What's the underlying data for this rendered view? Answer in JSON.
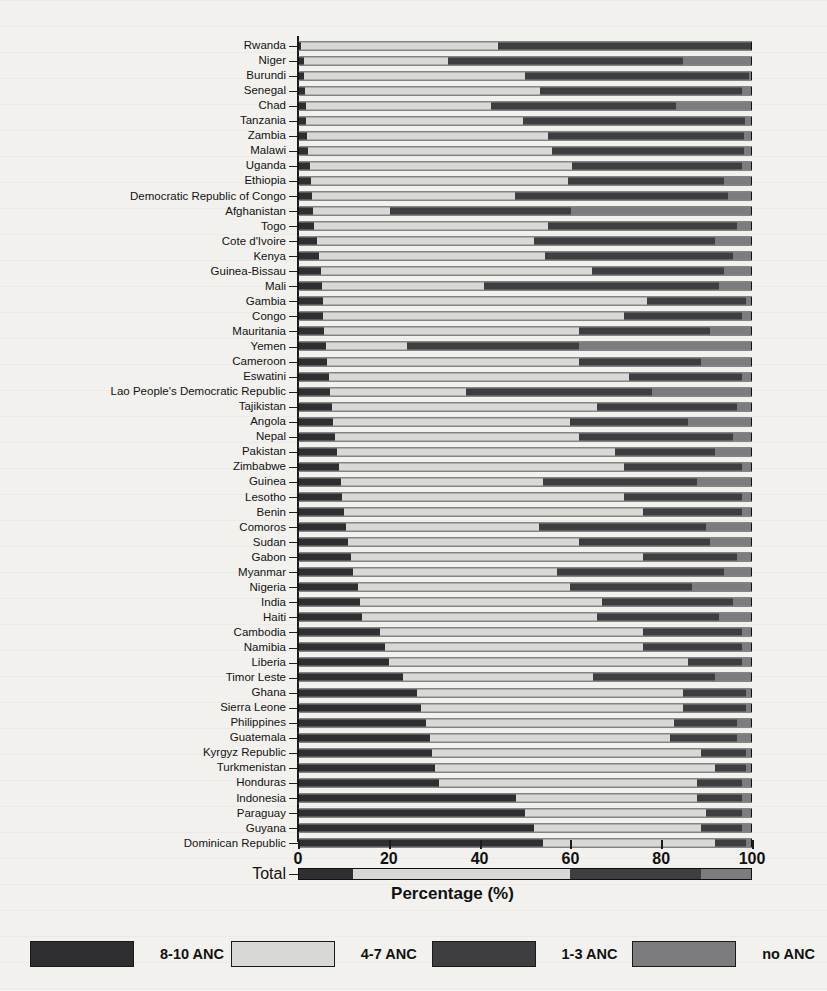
{
  "chart_data": {
    "type": "bar",
    "orientation": "horizontal",
    "stacked": true,
    "title": "",
    "xlabel": "Percentage (%)",
    "ylabel": "",
    "xlim": [
      0,
      100
    ],
    "xticks": [
      0,
      20,
      40,
      60,
      80,
      100
    ],
    "grid": false,
    "legend_position": "bottom",
    "legend": [
      "8-10 ANC",
      "4-7 ANC",
      "1-3 ANC",
      "no ANC"
    ],
    "series": [
      {
        "name": "8-10 ANC",
        "color": "#2f2f31"
      },
      {
        "name": "4-7 ANC",
        "color": "#d8d8d6"
      },
      {
        "name": "1-3 ANC",
        "color": "#3e3e40"
      },
      {
        "name": "no ANC",
        "color": "#7c7c7e"
      }
    ],
    "categories": [
      "Rwanda",
      "Niger",
      "Burundi",
      "Senegal",
      "Chad",
      "Tanzania",
      "Zambia",
      "Malawi",
      "Uganda",
      "Ethiopia",
      "Democratic Republic of Congo",
      "Afghanistan",
      "Togo",
      "Cote d'Ivoire",
      "Kenya",
      "Guinea-Bissau",
      "Mali",
      "Gambia",
      "Congo",
      "Mauritania",
      "Yemen",
      "Cameroon",
      "Eswatini",
      "Lao People's Democratic Republic",
      "Tajikistan",
      "Angola",
      "Nepal",
      "Pakistan",
      "Zimbabwe",
      "Guinea",
      "Lesotho",
      "Benin",
      "Comoros",
      "Sudan",
      "Gabon",
      "Myanmar",
      "Nigeria",
      "India",
      "Haiti",
      "Cambodia",
      "Namibia",
      "Liberia",
      "Timor Leste",
      "Ghana",
      "Sierra Leone",
      "Philippines",
      "Guatemala",
      "Kyrgyz Republic",
      "Turkmenistan",
      "Honduras",
      "Indonesia",
      "Paraguay",
      "Guyana",
      "Dominican Republic"
    ],
    "rows": [
      {
        "label": "Rwanda",
        "values": [
          0.5,
          43.5,
          56.0,
          0.0
        ]
      },
      {
        "label": "Niger",
        "values": [
          1.0,
          32.0,
          52.0,
          15.0
        ]
      },
      {
        "label": "Burundi",
        "values": [
          1.2,
          48.8,
          49.5,
          0.5
        ]
      },
      {
        "label": "Senegal",
        "values": [
          1.4,
          52.0,
          44.6,
          2.0
        ]
      },
      {
        "label": "Chad",
        "values": [
          1.5,
          41.0,
          41.0,
          16.5
        ]
      },
      {
        "label": "Tanzania",
        "values": [
          1.6,
          48.0,
          49.0,
          1.4
        ]
      },
      {
        "label": "Zambia",
        "values": [
          1.8,
          53.2,
          43.5,
          1.5
        ]
      },
      {
        "label": "Malawi",
        "values": [
          2.0,
          54.0,
          42.5,
          1.5
        ]
      },
      {
        "label": "Uganda",
        "values": [
          2.4,
          58.0,
          37.6,
          2.0
        ]
      },
      {
        "label": "Ethiopia",
        "values": [
          2.6,
          57.0,
          34.4,
          6.0
        ]
      },
      {
        "label": "Democratic Republic of Congo",
        "values": [
          2.8,
          45.0,
          47.2,
          5.0
        ]
      },
      {
        "label": "Afghanistan",
        "values": [
          3.2,
          17.0,
          40.0,
          39.8
        ]
      },
      {
        "label": "Togo",
        "values": [
          3.4,
          51.6,
          42.0,
          3.0
        ]
      },
      {
        "label": "Cote d'Ivoire",
        "values": [
          4.0,
          48.0,
          40.0,
          8.0
        ]
      },
      {
        "label": "Kenya",
        "values": [
          4.4,
          50.0,
          41.6,
          4.0
        ]
      },
      {
        "label": "Guinea-Bissau",
        "values": [
          4.8,
          60.0,
          29.2,
          6.0
        ]
      },
      {
        "label": "Mali",
        "values": [
          5.0,
          36.0,
          52.0,
          7.0
        ]
      },
      {
        "label": "Gambia",
        "values": [
          5.2,
          71.8,
          22.0,
          1.0
        ]
      },
      {
        "label": "Congo",
        "values": [
          5.4,
          66.6,
          26.0,
          2.0
        ]
      },
      {
        "label": "Mauritania",
        "values": [
          5.6,
          56.4,
          29.0,
          9.0
        ]
      },
      {
        "label": "Yemen",
        "values": [
          6.0,
          18.0,
          38.0,
          38.0
        ]
      },
      {
        "label": "Cameroon",
        "values": [
          6.2,
          55.8,
          27.0,
          11.0
        ]
      },
      {
        "label": "Eswatini",
        "values": [
          6.6,
          66.4,
          25.0,
          2.0
        ]
      },
      {
        "label": "Lao People's Democratic Republic",
        "values": [
          6.8,
          30.2,
          41.0,
          22.0
        ]
      },
      {
        "label": "Tajikistan",
        "values": [
          7.2,
          58.8,
          31.0,
          3.0
        ]
      },
      {
        "label": "Angola",
        "values": [
          7.6,
          52.4,
          26.0,
          14.0
        ]
      },
      {
        "label": "Nepal",
        "values": [
          8.0,
          54.0,
          34.0,
          4.0
        ]
      },
      {
        "label": "Pakistan",
        "values": [
          8.4,
          61.6,
          22.0,
          8.0
        ]
      },
      {
        "label": "Zimbabwe",
        "values": [
          8.8,
          63.2,
          26.0,
          2.0
        ]
      },
      {
        "label": "Guinea",
        "values": [
          9.2,
          44.8,
          34.0,
          12.0
        ]
      },
      {
        "label": "Lesotho",
        "values": [
          9.6,
          62.4,
          26.0,
          2.0
        ]
      },
      {
        "label": "Benin",
        "values": [
          10.0,
          66.0,
          22.0,
          2.0
        ]
      },
      {
        "label": "Comoros",
        "values": [
          10.4,
          42.6,
          37.0,
          10.0
        ]
      },
      {
        "label": "Sudan",
        "values": [
          10.8,
          51.2,
          29.0,
          9.0
        ]
      },
      {
        "label": "Gabon",
        "values": [
          11.4,
          64.6,
          21.0,
          3.0
        ]
      },
      {
        "label": "Myanmar",
        "values": [
          12.0,
          45.0,
          37.0,
          6.0
        ]
      },
      {
        "label": "Nigeria",
        "values": [
          13.0,
          47.0,
          27.0,
          13.0
        ]
      },
      {
        "label": "India",
        "values": [
          13.6,
          53.4,
          29.0,
          4.0
        ]
      },
      {
        "label": "Haiti",
        "values": [
          14.0,
          52.0,
          27.0,
          7.0
        ]
      },
      {
        "label": "Cambodia",
        "values": [
          18.0,
          58.0,
          22.0,
          2.0
        ]
      },
      {
        "label": "Namibia",
        "values": [
          19.0,
          57.0,
          22.0,
          2.0
        ]
      },
      {
        "label": "Liberia",
        "values": [
          20.0,
          66.0,
          12.0,
          2.0
        ]
      },
      {
        "label": "Timor Leste",
        "values": [
          23.0,
          42.0,
          27.0,
          8.0
        ]
      },
      {
        "label": "Ghana",
        "values": [
          26.0,
          59.0,
          14.0,
          1.0
        ]
      },
      {
        "label": "Sierra Leone",
        "values": [
          27.0,
          58.0,
          14.0,
          1.0
        ]
      },
      {
        "label": "Philippines",
        "values": [
          28.0,
          55.0,
          14.0,
          3.0
        ]
      },
      {
        "label": "Guatemala",
        "values": [
          29.0,
          53.0,
          15.0,
          3.0
        ]
      },
      {
        "label": "Kyrgyz Republic",
        "values": [
          29.5,
          59.5,
          10.0,
          1.0
        ]
      },
      {
        "label": "Turkmenistan",
        "values": [
          30.0,
          62.0,
          7.0,
          1.0
        ]
      },
      {
        "label": "Honduras",
        "values": [
          31.0,
          57.0,
          10.0,
          2.0
        ]
      },
      {
        "label": "Indonesia",
        "values": [
          48.0,
          40.0,
          10.0,
          2.0
        ]
      },
      {
        "label": "Paraguay",
        "values": [
          50.0,
          40.0,
          8.0,
          2.0
        ]
      },
      {
        "label": "Guyana",
        "values": [
          52.0,
          37.0,
          9.0,
          2.0
        ]
      },
      {
        "label": "Dominican Republic",
        "values": [
          54.0,
          38.0,
          7.0,
          1.0
        ]
      }
    ],
    "total_row": {
      "label": "Total",
      "values": [
        12.0,
        48.0,
        29.0,
        11.0
      ]
    }
  },
  "axis": {
    "x_title": "Percentage (%)",
    "ticks": [
      "0",
      "20",
      "40",
      "60",
      "80",
      "100"
    ]
  },
  "legend": {
    "items": [
      {
        "label": "8-10 ANC",
        "color": "#2f2f31"
      },
      {
        "label": "4-7 ANC",
        "color": "#d8d8d6"
      },
      {
        "label": "1-3 ANC",
        "color": "#3e3e40"
      },
      {
        "label": "no ANC",
        "color": "#7c7c7e"
      }
    ]
  }
}
